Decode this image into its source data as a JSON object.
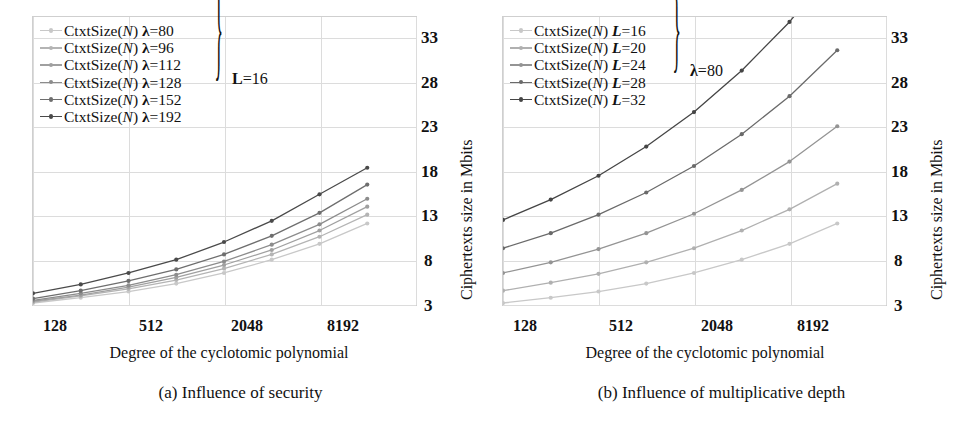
{
  "figure": {
    "width": 962,
    "height": 440
  },
  "subfigures": [
    {
      "id": "a",
      "caption": "(a) Influence of security",
      "legend_brace_label": "L=16",
      "chart": {
        "xlabel": "Degree of the cyclotomic polynomial",
        "ylabel": "Ciphertexts size in Mbits",
        "xticks": [
          "128",
          "512",
          "2048",
          "8192"
        ],
        "yticks": [
          "3",
          "8",
          "13",
          "18",
          "23",
          "28",
          "33"
        ]
      }
    },
    {
      "id": "b",
      "caption": "(b) Influence of multiplicative depth",
      "legend_brace_label": "λ=80",
      "chart": {
        "xlabel": "Degree of the cyclotomic polynomial",
        "ylabel": "Ciphertexts size in Mbits",
        "xticks": [
          "128",
          "512",
          "2048",
          "8192"
        ],
        "yticks": [
          "3",
          "8",
          "13",
          "18",
          "23",
          "28",
          "33"
        ]
      }
    }
  ],
  "chart_data": [
    {
      "type": "line",
      "id": "a",
      "title": "(a) Influence of security",
      "xlabel": "Degree of the cyclotomic polynomial",
      "ylabel": "Ciphertexts size in Mbits",
      "xscale": "log2",
      "x": [
        128,
        256,
        512,
        1024,
        2048,
        4096,
        8192,
        16384
      ],
      "xticks": [
        128,
        512,
        2048,
        8192
      ],
      "yticks": [
        3,
        8,
        13,
        18,
        23,
        28,
        33
      ],
      "ylim": [
        2.6,
        35.5
      ],
      "grid": true,
      "legend_position": "top-left",
      "legend_brace_label": "L=16",
      "series": [
        {
          "name": "CtxtSize(N) λ=80",
          "lambda": 80,
          "color": "#c8c8c8",
          "values": [
            3.0,
            3.6,
            4.3,
            5.2,
            6.4,
            7.9,
            9.7,
            12.0
          ]
        },
        {
          "name": "CtxtSize(N) λ=96",
          "lambda": 96,
          "color": "#b4b4b4",
          "values": [
            3.1,
            3.8,
            4.6,
            5.6,
            6.9,
            8.5,
            10.5,
            13.0
          ]
        },
        {
          "name": "CtxtSize(N) λ=112",
          "lambda": 112,
          "color": "#a0a0a0",
          "values": [
            3.2,
            3.9,
            4.8,
            5.9,
            7.3,
            9.0,
            11.2,
            13.9
          ]
        },
        {
          "name": "CtxtSize(N) λ=128",
          "lambda": 128,
          "color": "#8c8c8c",
          "values": [
            3.3,
            4.1,
            5.0,
            6.2,
            7.7,
            9.6,
            11.9,
            14.8
          ]
        },
        {
          "name": "CtxtSize(N) λ=152",
          "lambda": 152,
          "color": "#6e6e6e",
          "values": [
            3.5,
            4.4,
            5.5,
            6.8,
            8.5,
            10.6,
            13.2,
            16.4
          ]
        },
        {
          "name": "CtxtSize(N) λ=192",
          "lambda": 192,
          "color": "#4a4a4a",
          "values": [
            4.1,
            5.1,
            6.4,
            7.9,
            9.9,
            12.3,
            15.3,
            18.3
          ]
        }
      ]
    },
    {
      "type": "line",
      "id": "b",
      "title": "(b) Influence of multiplicative depth",
      "xlabel": "Degree of the cyclotomic polynomial",
      "ylabel": "Ciphertexts size in Mbits",
      "xscale": "log2",
      "x": [
        128,
        256,
        512,
        1024,
        2048,
        4096,
        8192,
        16384
      ],
      "xticks": [
        128,
        512,
        2048,
        8192
      ],
      "yticks": [
        3,
        8,
        13,
        18,
        23,
        28,
        33
      ],
      "ylim": [
        2.6,
        35.5
      ],
      "grid": true,
      "legend_position": "top-left",
      "legend_brace_label": "λ=80",
      "series": [
        {
          "name": "CtxtSize(N) L=16",
          "L": 16,
          "color": "#c8c8c8",
          "values": [
            3.0,
            3.6,
            4.3,
            5.2,
            6.4,
            7.9,
            9.7,
            12.0
          ]
        },
        {
          "name": "CtxtSize(N) L=20",
          "L": 20,
          "color": "#b0b0b0",
          "values": [
            4.4,
            5.3,
            6.3,
            7.6,
            9.2,
            11.2,
            13.6,
            16.5
          ]
        },
        {
          "name": "CtxtSize(N) L=24",
          "L": 24,
          "color": "#949494",
          "values": [
            6.4,
            7.6,
            9.1,
            10.9,
            13.1,
            15.8,
            19.0,
            23.0
          ]
        },
        {
          "name": "CtxtSize(N) L=28",
          "L": 28,
          "color": "#6a6a6a",
          "values": [
            9.2,
            10.9,
            13.0,
            15.5,
            18.5,
            22.1,
            26.4,
            31.6
          ]
        },
        {
          "name": "CtxtSize(N) L=32",
          "L": 32,
          "color": "#454545",
          "values": [
            12.4,
            14.7,
            17.4,
            20.7,
            24.6,
            29.3,
            34.8,
            41.5
          ]
        }
      ]
    }
  ]
}
